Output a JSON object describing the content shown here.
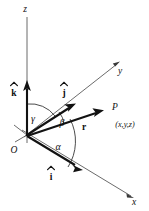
{
  "figure": {
    "background_color": "#ffffff",
    "axis_color": "#5a5a5a",
    "vector_color": "#121212",
    "arc_color": "#2a2a2a"
  },
  "axes": [
    {
      "id": "z",
      "label": "z",
      "description": "vertical axis pointing up"
    },
    {
      "id": "y",
      "label": "y",
      "description": "axis receding to upper right"
    },
    {
      "id": "x",
      "label": "x",
      "description": "axis coming toward lower right"
    }
  ],
  "unit_vectors": [
    {
      "id": "i",
      "label": "i",
      "accent": "hat",
      "along_axis": "x"
    },
    {
      "id": "j",
      "label": "j",
      "accent": "hat",
      "along_axis": "y"
    },
    {
      "id": "k",
      "label": "k",
      "accent": "hat",
      "along_axis": "z"
    }
  ],
  "position_vector": {
    "label": "r",
    "accent": "bold",
    "terminal_point": "P",
    "coordinates": "(x,y,z)"
  },
  "origin": {
    "label": "O"
  },
  "angles": [
    {
      "id": "alpha",
      "label": "α",
      "between": "r and x-axis"
    },
    {
      "id": "beta",
      "label": "β",
      "between": "r and y-axis"
    },
    {
      "id": "gamma",
      "label": "γ",
      "between": "r and z-axis"
    }
  ]
}
